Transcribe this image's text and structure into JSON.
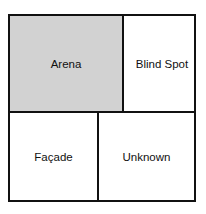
{
  "diagram": {
    "type": "johari-window",
    "panes": [
      {
        "id": "arena",
        "label": "Arena",
        "fill": "#d2d2d2"
      },
      {
        "id": "blind_spot",
        "label": "Blind Spot",
        "fill": "#ffffff"
      },
      {
        "id": "facade",
        "label": "Façade",
        "fill": "#ffffff"
      },
      {
        "id": "unknown",
        "label": "Unknown",
        "fill": "#ffffff"
      }
    ],
    "border_color": "#111111"
  }
}
